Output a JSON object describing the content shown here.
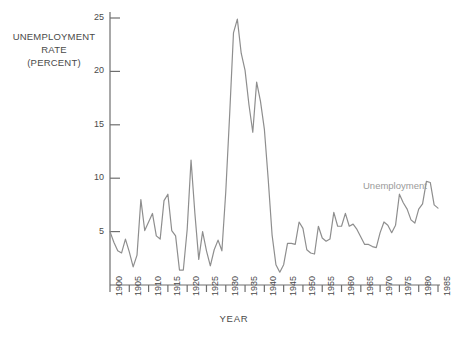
{
  "chart_data": {
    "type": "line",
    "title": "",
    "xlabel": "YEAR",
    "ylabel": "UNEMPLOYMENT RATE (PERCENT)",
    "ylabel_lines": [
      "UNEMPLOYMENT",
      "RATE",
      "(PERCENT)"
    ],
    "xlim": [
      1900,
      1985
    ],
    "ylim": [
      0,
      26.5
    ],
    "grid": false,
    "legend_position": "inline-right",
    "line_color": "#8e8e8e",
    "axis_color": "#6e6e6e",
    "text_color": "#4a4a4a",
    "yticks": [
      5,
      10,
      15,
      20,
      25
    ],
    "ytick_labels": [
      "5",
      "10",
      "15",
      "20",
      "25"
    ],
    "xticks": [
      1900,
      1905,
      1910,
      1915,
      1920,
      1925,
      1930,
      1935,
      1940,
      1945,
      1950,
      1955,
      1960,
      1965,
      1970,
      1975,
      1980,
      1985
    ],
    "xtick_labels": [
      "1900",
      "1905",
      "1910",
      "1915",
      "1920",
      "1925",
      "1930",
      "1935",
      "1940",
      "1945",
      "1950",
      "1955",
      "1960",
      "1965",
      "1970",
      "1975",
      "1980",
      "1985"
    ],
    "series": [
      {
        "name": "Unemployment",
        "label": "Unemployment",
        "color": "#8e8e8e",
        "x": [
          1900,
          1901,
          1902,
          1903,
          1904,
          1905,
          1906,
          1907,
          1908,
          1909,
          1910,
          1911,
          1912,
          1913,
          1914,
          1915,
          1916,
          1917,
          1918,
          1919,
          1920,
          1921,
          1922,
          1923,
          1924,
          1925,
          1926,
          1927,
          1928,
          1929,
          1930,
          1931,
          1932,
          1933,
          1934,
          1935,
          1936,
          1937,
          1938,
          1939,
          1940,
          1941,
          1942,
          1943,
          1944,
          1945,
          1946,
          1947,
          1948,
          1949,
          1950,
          1951,
          1952,
          1953,
          1954,
          1955,
          1956,
          1957,
          1958,
          1959,
          1960,
          1961,
          1962,
          1963,
          1964,
          1965,
          1966,
          1967,
          1968,
          1969,
          1970,
          1971,
          1972,
          1973,
          1974,
          1975,
          1976,
          1977,
          1978,
          1979,
          1980,
          1981,
          1982,
          1983,
          1984,
          1985
        ],
        "values": [
          5.0,
          4.0,
          3.2,
          3.0,
          4.3,
          3.1,
          1.7,
          2.8,
          8.0,
          5.1,
          5.9,
          6.7,
          4.6,
          4.3,
          7.9,
          8.5,
          5.1,
          4.6,
          1.4,
          1.4,
          5.2,
          11.7,
          6.7,
          2.4,
          5.0,
          3.2,
          1.8,
          3.3,
          4.2,
          3.2,
          8.7,
          15.9,
          23.6,
          24.9,
          21.7,
          20.1,
          16.9,
          14.3,
          19.0,
          17.2,
          14.6,
          9.9,
          4.7,
          1.9,
          1.2,
          1.9,
          3.9,
          3.9,
          3.8,
          5.9,
          5.3,
          3.3,
          3.0,
          2.9,
          5.5,
          4.4,
          4.1,
          4.3,
          6.8,
          5.5,
          5.5,
          6.7,
          5.5,
          5.7,
          5.2,
          4.5,
          3.8,
          3.8,
          3.6,
          3.5,
          4.9,
          5.9,
          5.6,
          4.9,
          5.6,
          8.5,
          7.7,
          7.1,
          6.1,
          5.8,
          7.1,
          7.6,
          9.7,
          9.6,
          7.5,
          7.2
        ]
      }
    ]
  }
}
